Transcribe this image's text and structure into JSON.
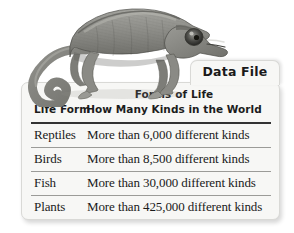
{
  "figure": {
    "illustration": {
      "subject": "chameleon",
      "alt": "chameleon-illustration"
    },
    "tab": {
      "label": "Data File"
    },
    "table": {
      "title": "Forms of Life",
      "columns": [
        "Life Form",
        "How Many Kinds in the World"
      ],
      "rows": [
        {
          "life_form": "Reptiles",
          "kinds": "More than 6,000 different kinds"
        },
        {
          "life_form": "Birds",
          "kinds": "More than 8,500 different kinds"
        },
        {
          "life_form": "Fish",
          "kinds": "More than 30,000 different kinds"
        },
        {
          "life_form": "Plants",
          "kinds": "More than 425,000 different kinds"
        }
      ]
    },
    "colors": {
      "card_background": "#f7f7f5",
      "card_border": "#d9d9d6",
      "text": "#1a1a1a",
      "header_rule": "#333333",
      "row_rule": "#9b9b98",
      "page_background": "#ffffff"
    }
  }
}
